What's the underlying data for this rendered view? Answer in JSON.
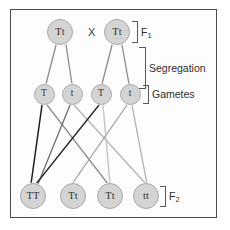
{
  "figure": {
    "background_color": "#fdfdfd",
    "frame_color": "#4a4a4a",
    "node_fill": "#d4d4d4",
    "node_stroke": "#a8a8a8",
    "text_color": "#333333"
  },
  "cross_symbol": "X",
  "generations": {
    "f1": {
      "label": "F",
      "subscript": "1",
      "nodes": [
        {
          "genotype": "Tt",
          "x": 60,
          "y": 32
        },
        {
          "genotype": "Tt",
          "x": 117,
          "y": 32
        }
      ]
    },
    "gametes": {
      "label": "Gametes",
      "nodes": [
        {
          "genotype": "T",
          "x": 44,
          "y": 94
        },
        {
          "genotype": "t",
          "x": 72,
          "y": 94
        },
        {
          "genotype": "T",
          "x": 101,
          "y": 94
        },
        {
          "genotype": "t",
          "x": 130,
          "y": 94
        }
      ]
    },
    "f2": {
      "label": "F",
      "subscript": "2",
      "nodes": [
        {
          "genotype": "TT",
          "x": 33,
          "y": 196
        },
        {
          "genotype": "Tt",
          "x": 73,
          "y": 196
        },
        {
          "genotype": "Tt",
          "x": 110,
          "y": 196
        },
        {
          "genotype": "tt",
          "x": 146,
          "y": 196
        }
      ]
    }
  },
  "segregation_label": "Segregation",
  "edges": {
    "meiosis": [
      {
        "x1": 56,
        "y1": 45,
        "x2": 46,
        "y2": 84,
        "color": "#8c8c8c",
        "width": 1.3
      },
      {
        "x1": 66,
        "y1": 45,
        "x2": 72,
        "y2": 84,
        "color": "#8c8c8c",
        "width": 1.3
      },
      {
        "x1": 112,
        "y1": 45,
        "x2": 102,
        "y2": 84,
        "color": "#8c8c8c",
        "width": 1.3
      },
      {
        "x1": 122,
        "y1": 45,
        "x2": 129,
        "y2": 84,
        "color": "#8c8c8c",
        "width": 1.3
      }
    ],
    "fertilization": [
      {
        "x1": 42,
        "y1": 105,
        "x2": 31,
        "y2": 184,
        "color": "#1d1d1d",
        "width": 1.5
      },
      {
        "x1": 47,
        "y1": 105,
        "x2": 108,
        "y2": 184,
        "color": "#8f8f8f",
        "width": 1.3
      },
      {
        "x1": 70,
        "y1": 105,
        "x2": 38,
        "y2": 184,
        "color": "#6e6e6e",
        "width": 1.3
      },
      {
        "x1": 74,
        "y1": 105,
        "x2": 146,
        "y2": 184,
        "color": "#b4b4b4",
        "width": 1.3
      },
      {
        "x1": 99,
        "y1": 105,
        "x2": 36,
        "y2": 184,
        "color": "#2b2b2b",
        "width": 1.4
      },
      {
        "x1": 103,
        "y1": 105,
        "x2": 110,
        "y2": 184,
        "color": "#c2c2c2",
        "width": 1.3
      },
      {
        "x1": 127,
        "y1": 105,
        "x2": 72,
        "y2": 184,
        "color": "#a0a0a0",
        "width": 1.3
      },
      {
        "x1": 132,
        "y1": 105,
        "x2": 147,
        "y2": 184,
        "color": "#b0b0b0",
        "width": 1.3
      }
    ]
  }
}
